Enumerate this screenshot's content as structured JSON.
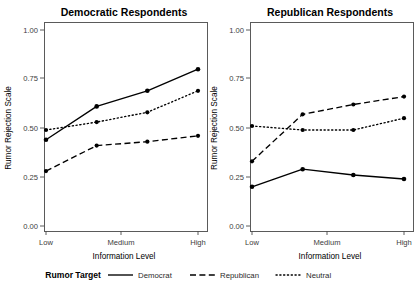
{
  "figure": {
    "background": "#ffffff",
    "ink_color": "#000000"
  },
  "axis": {
    "xlabel": "Information Level",
    "ylabel": "Rumor Rejection Scale",
    "x_tick_labels": [
      "Low",
      "Medium",
      "High"
    ],
    "y_tick_labels": [
      "0.00",
      "0.25",
      "0.50",
      "0.75",
      "1.00"
    ]
  },
  "legend": {
    "title": "Rumor Target",
    "items": [
      {
        "label": "Democrat",
        "dash": "solid"
      },
      {
        "label": "Republican",
        "dash": "dashed"
      },
      {
        "label": "Neutral",
        "dash": "dotted"
      }
    ]
  },
  "panels": [
    {
      "title": "Democratic Respondents"
    },
    {
      "title": "Republican Respondents"
    }
  ],
  "chart_data": [
    {
      "type": "line",
      "title": "Democratic Respondents",
      "xlabel": "Information Level",
      "ylabel": "Rumor Rejection Scale",
      "ylim": [
        0.0,
        1.0
      ],
      "yticks": [
        0.0,
        0.25,
        0.5,
        0.75,
        1.0
      ],
      "x": [
        0,
        1,
        2,
        3
      ],
      "x_tick_positions": [
        0,
        1.5,
        3
      ],
      "categories": [
        "Low",
        "",
        "Medium",
        "High"
      ],
      "xtick_labels": [
        "Low",
        "Medium",
        "High"
      ],
      "grid": false,
      "legend_position": "bottom",
      "series": [
        {
          "name": "Democrat",
          "dash": "solid",
          "values": [
            0.44,
            0.61,
            0.69,
            0.8
          ]
        },
        {
          "name": "Republican",
          "dash": "dashed",
          "values": [
            0.28,
            0.41,
            0.43,
            0.46
          ]
        },
        {
          "name": "Neutral",
          "dash": "dotted",
          "values": [
            0.49,
            0.53,
            0.58,
            0.69
          ]
        }
      ]
    },
    {
      "type": "line",
      "title": "Republican Respondents",
      "xlabel": "Information Level",
      "ylabel": "Rumor Rejection Scale",
      "ylim": [
        0.0,
        1.0
      ],
      "yticks": [
        0.0,
        0.25,
        0.5,
        0.75,
        1.0
      ],
      "x": [
        0,
        1,
        2,
        3
      ],
      "x_tick_positions": [
        0,
        1.5,
        3
      ],
      "categories": [
        "Low",
        "",
        "Medium",
        "High"
      ],
      "xtick_labels": [
        "Low",
        "Medium",
        "High"
      ],
      "grid": false,
      "legend_position": "bottom",
      "series": [
        {
          "name": "Democrat",
          "dash": "solid",
          "values": [
            0.2,
            0.29,
            0.26,
            0.24
          ]
        },
        {
          "name": "Republican",
          "dash": "dashed",
          "values": [
            0.33,
            0.57,
            0.62,
            0.66
          ]
        },
        {
          "name": "Neutral",
          "dash": "dotted",
          "values": [
            0.51,
            0.49,
            0.49,
            0.55
          ]
        }
      ]
    }
  ]
}
